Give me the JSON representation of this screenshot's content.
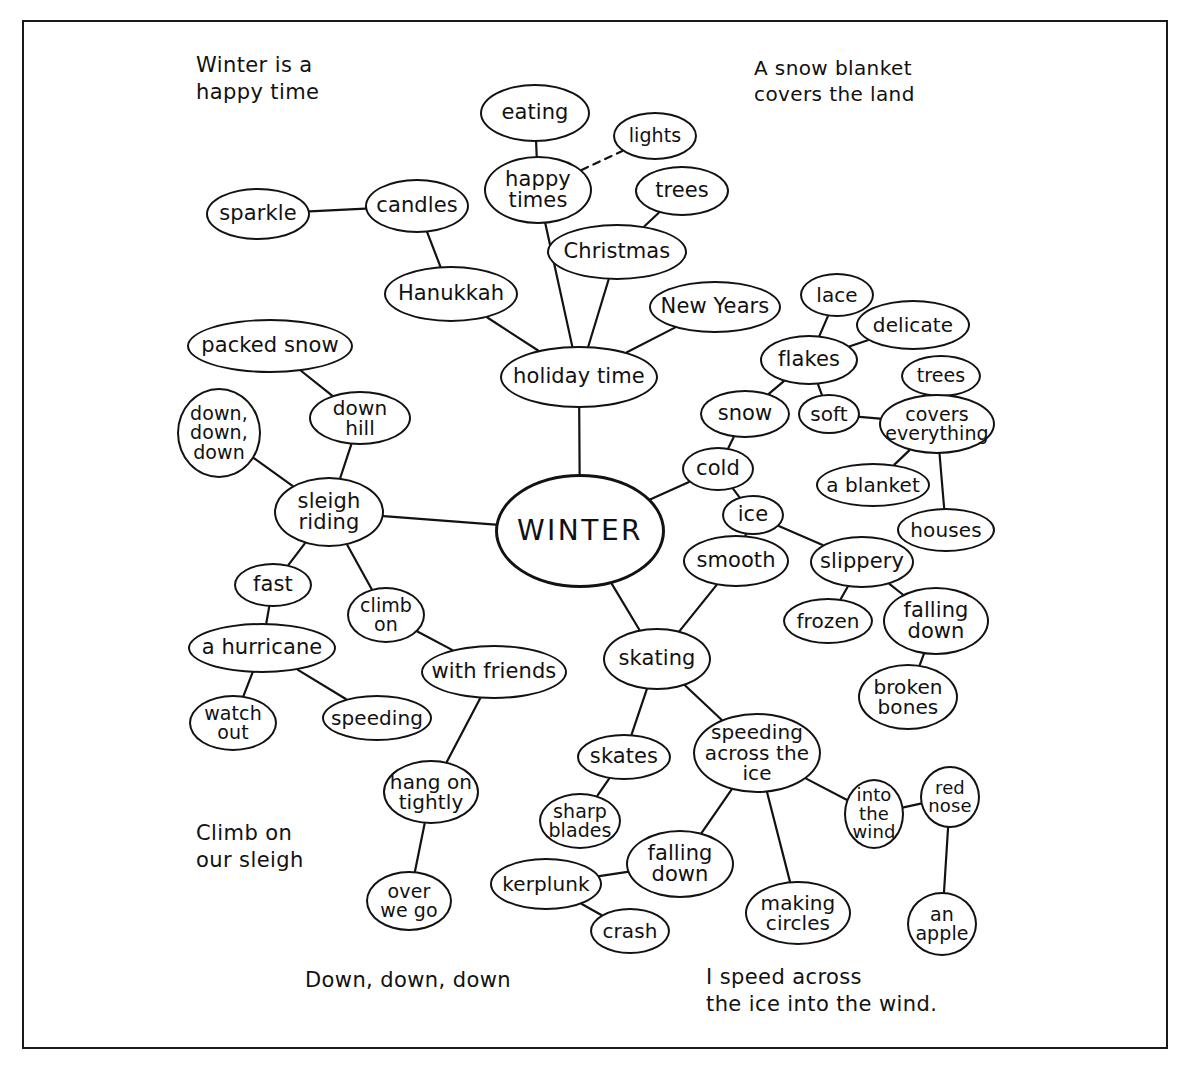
{
  "style": {
    "ink": "#121212",
    "paper": "#ffffff"
  },
  "captions": [
    {
      "id": "cap-winter-happy",
      "text": "Winter is a\nhappy time",
      "x": 196,
      "y": 52,
      "size": 21
    },
    {
      "id": "cap-snow-blanket",
      "text": "A snow blanket\ncovers the land",
      "x": 754,
      "y": 56,
      "size": 20
    },
    {
      "id": "cap-climb-sleigh",
      "text": "Climb on\nour sleigh",
      "x": 196,
      "y": 820,
      "size": 21
    },
    {
      "id": "cap-down-down-down",
      "text": "Down, down, down",
      "x": 305,
      "y": 967,
      "size": 21
    },
    {
      "id": "cap-speed-ice",
      "text": "I speed across\nthe ice into the wind.",
      "x": 706,
      "y": 964,
      "size": 21
    }
  ],
  "central_node": "winter",
  "nodes": [
    {
      "id": "eating",
      "label": "eating",
      "cx": 535,
      "cy": 113,
      "rx": 55,
      "ry": 29,
      "size": 21
    },
    {
      "id": "lights",
      "label": "lights",
      "cx": 655,
      "cy": 136,
      "rx": 42,
      "ry": 24,
      "size": 19
    },
    {
      "id": "happy-times",
      "label": "happy\ntimes",
      "cx": 538,
      "cy": 190,
      "rx": 54,
      "ry": 34,
      "size": 21
    },
    {
      "id": "trees-top",
      "label": "trees",
      "cx": 682,
      "cy": 191,
      "rx": 47,
      "ry": 25,
      "size": 21
    },
    {
      "id": "christmas",
      "label": "Christmas",
      "cx": 617,
      "cy": 252,
      "rx": 70,
      "ry": 28,
      "size": 21
    },
    {
      "id": "sparkle",
      "label": "sparkle",
      "cx": 258,
      "cy": 214,
      "rx": 52,
      "ry": 26,
      "size": 21
    },
    {
      "id": "candles",
      "label": "candles",
      "cx": 417,
      "cy": 206,
      "rx": 52,
      "ry": 27,
      "size": 21
    },
    {
      "id": "hanukkah",
      "label": "Hanukkah",
      "cx": 451,
      "cy": 294,
      "rx": 67,
      "ry": 28,
      "size": 21
    },
    {
      "id": "new-years",
      "label": "New Years",
      "cx": 715,
      "cy": 307,
      "rx": 66,
      "ry": 26,
      "size": 21
    },
    {
      "id": "lace",
      "label": "lace",
      "cx": 837,
      "cy": 295,
      "rx": 37,
      "ry": 22,
      "size": 20
    },
    {
      "id": "delicate",
      "label": "delicate",
      "cx": 913,
      "cy": 325,
      "rx": 57,
      "ry": 25,
      "size": 20
    },
    {
      "id": "flakes",
      "label": "flakes",
      "cx": 809,
      "cy": 360,
      "rx": 49,
      "ry": 25,
      "size": 21
    },
    {
      "id": "trees-right",
      "label": "trees",
      "cx": 941,
      "cy": 376,
      "rx": 40,
      "ry": 21,
      "size": 19
    },
    {
      "id": "holiday-time",
      "label": "holiday time",
      "cx": 579,
      "cy": 377,
      "rx": 79,
      "ry": 31,
      "size": 21
    },
    {
      "id": "packed-snow",
      "label": "packed snow",
      "cx": 270,
      "cy": 346,
      "rx": 83,
      "ry": 27,
      "size": 21
    },
    {
      "id": "down-hill",
      "label": "down\nhill",
      "cx": 360,
      "cy": 418,
      "rx": 51,
      "ry": 27,
      "size": 20
    },
    {
      "id": "snow",
      "label": "snow",
      "cx": 745,
      "cy": 414,
      "rx": 45,
      "ry": 24,
      "size": 21
    },
    {
      "id": "soft",
      "label": "soft",
      "cx": 829,
      "cy": 414,
      "rx": 31,
      "ry": 20,
      "size": 20
    },
    {
      "id": "covers-everything",
      "label": "covers\neverything",
      "cx": 937,
      "cy": 424,
      "rx": 58,
      "ry": 30,
      "size": 19
    },
    {
      "id": "down-down-down",
      "label": "down,\ndown,\ndown",
      "cx": 219,
      "cy": 433,
      "rx": 42,
      "ry": 45,
      "size": 19
    },
    {
      "id": "cold",
      "label": "cold",
      "cx": 718,
      "cy": 469,
      "rx": 36,
      "ry": 22,
      "size": 21
    },
    {
      "id": "a-blanket",
      "label": "a blanket",
      "cx": 873,
      "cy": 485,
      "rx": 57,
      "ry": 22,
      "size": 20
    },
    {
      "id": "sleigh-riding",
      "label": "sleigh\nriding",
      "cx": 329,
      "cy": 512,
      "rx": 55,
      "ry": 35,
      "size": 21
    },
    {
      "id": "ice",
      "label": "ice",
      "cx": 753,
      "cy": 515,
      "rx": 31,
      "ry": 20,
      "size": 21
    },
    {
      "id": "houses",
      "label": "houses",
      "cx": 946,
      "cy": 530,
      "rx": 49,
      "ry": 22,
      "size": 20
    },
    {
      "id": "winter",
      "label": "WINTER",
      "cx": 580,
      "cy": 531,
      "rx": 85,
      "ry": 57,
      "size": 28
    },
    {
      "id": "smooth",
      "label": "smooth",
      "cx": 736,
      "cy": 561,
      "rx": 53,
      "ry": 26,
      "size": 21
    },
    {
      "id": "slippery",
      "label": "slippery",
      "cx": 862,
      "cy": 562,
      "rx": 52,
      "ry": 26,
      "size": 21
    },
    {
      "id": "fast",
      "label": "fast",
      "cx": 273,
      "cy": 585,
      "rx": 39,
      "ry": 22,
      "size": 21
    },
    {
      "id": "climb-on",
      "label": "climb\non",
      "cx": 386,
      "cy": 615,
      "rx": 39,
      "ry": 28,
      "size": 19
    },
    {
      "id": "frozen",
      "label": "frozen",
      "cx": 828,
      "cy": 621,
      "rx": 45,
      "ry": 23,
      "size": 20
    },
    {
      "id": "falling-down-r",
      "label": "falling\ndown",
      "cx": 936,
      "cy": 621,
      "rx": 53,
      "ry": 34,
      "size": 21
    },
    {
      "id": "a-hurricane",
      "label": "a hurricane",
      "cx": 262,
      "cy": 648,
      "rx": 74,
      "ry": 25,
      "size": 21
    },
    {
      "id": "with-friends",
      "label": "with friends",
      "cx": 494,
      "cy": 672,
      "rx": 73,
      "ry": 27,
      "size": 21
    },
    {
      "id": "skating",
      "label": "skating",
      "cx": 657,
      "cy": 659,
      "rx": 54,
      "ry": 31,
      "size": 21
    },
    {
      "id": "broken-bones",
      "label": "broken\nbones",
      "cx": 908,
      "cy": 697,
      "rx": 50,
      "ry": 33,
      "size": 20
    },
    {
      "id": "watch-out",
      "label": "watch\nout",
      "cx": 233,
      "cy": 723,
      "rx": 44,
      "ry": 28,
      "size": 19
    },
    {
      "id": "speeding",
      "label": "speeding",
      "cx": 377,
      "cy": 718,
      "rx": 55,
      "ry": 23,
      "size": 20
    },
    {
      "id": "skates",
      "label": "skates",
      "cx": 624,
      "cy": 757,
      "rx": 47,
      "ry": 23,
      "size": 21
    },
    {
      "id": "speeding-ice",
      "label": "speeding\nacross the\nice",
      "cx": 757,
      "cy": 753,
      "rx": 64,
      "ry": 40,
      "size": 20
    },
    {
      "id": "hang-on-tightly",
      "label": "hang on\ntightly",
      "cx": 431,
      "cy": 792,
      "rx": 48,
      "ry": 32,
      "size": 20
    },
    {
      "id": "into-the-wind",
      "label": "into\nthe\nwind",
      "cx": 874,
      "cy": 814,
      "rx": 30,
      "ry": 35,
      "size": 18
    },
    {
      "id": "red-nose",
      "label": "red\nnose",
      "cx": 950,
      "cy": 797,
      "rx": 30,
      "ry": 31,
      "size": 18
    },
    {
      "id": "sharp-blades",
      "label": "sharp\nblades",
      "cx": 580,
      "cy": 821,
      "rx": 41,
      "ry": 28,
      "size": 19
    },
    {
      "id": "falling-down-b",
      "label": "falling\ndown",
      "cx": 680,
      "cy": 864,
      "rx": 54,
      "ry": 34,
      "size": 21
    },
    {
      "id": "kerplunk",
      "label": "kerplunk",
      "cx": 546,
      "cy": 884,
      "rx": 56,
      "ry": 26,
      "size": 20
    },
    {
      "id": "over-we-go",
      "label": "over\nwe go",
      "cx": 409,
      "cy": 901,
      "rx": 43,
      "ry": 30,
      "size": 19
    },
    {
      "id": "making-circles",
      "label": "making\ncircles",
      "cx": 798,
      "cy": 913,
      "rx": 53,
      "ry": 32,
      "size": 20
    },
    {
      "id": "crash",
      "label": "crash",
      "cx": 630,
      "cy": 931,
      "rx": 40,
      "ry": 23,
      "size": 20
    },
    {
      "id": "an-apple",
      "label": "an\napple",
      "cx": 942,
      "cy": 924,
      "rx": 35,
      "ry": 32,
      "size": 19
    }
  ],
  "edges": [
    {
      "from": "eating",
      "to": "happy-times",
      "style": "solid"
    },
    {
      "from": "happy-times",
      "to": "lights",
      "style": "dashed"
    },
    {
      "from": "happy-times",
      "to": "holiday-time",
      "style": "solid"
    },
    {
      "from": "sparkle",
      "to": "candles",
      "style": "solid"
    },
    {
      "from": "candles",
      "to": "hanukkah",
      "style": "solid"
    },
    {
      "from": "hanukkah",
      "to": "holiday-time",
      "style": "solid"
    },
    {
      "from": "trees-top",
      "to": "christmas",
      "style": "solid"
    },
    {
      "from": "christmas",
      "to": "holiday-time",
      "style": "solid"
    },
    {
      "from": "new-years",
      "to": "holiday-time",
      "style": "solid"
    },
    {
      "from": "holiday-time",
      "to": "winter",
      "style": "solid"
    },
    {
      "from": "lace",
      "to": "flakes",
      "style": "solid"
    },
    {
      "from": "delicate",
      "to": "flakes",
      "style": "solid"
    },
    {
      "from": "flakes",
      "to": "snow",
      "style": "solid"
    },
    {
      "from": "flakes",
      "to": "soft",
      "style": "solid"
    },
    {
      "from": "soft",
      "to": "covers-everything",
      "style": "solid"
    },
    {
      "from": "trees-right",
      "to": "covers-everything",
      "style": "solid"
    },
    {
      "from": "covers-everything",
      "to": "a-blanket",
      "style": "solid"
    },
    {
      "from": "covers-everything",
      "to": "houses",
      "style": "solid"
    },
    {
      "from": "snow",
      "to": "cold",
      "style": "solid"
    },
    {
      "from": "cold",
      "to": "winter",
      "style": "solid"
    },
    {
      "from": "cold",
      "to": "ice",
      "style": "solid"
    },
    {
      "from": "ice",
      "to": "smooth",
      "style": "solid"
    },
    {
      "from": "ice",
      "to": "slippery",
      "style": "solid"
    },
    {
      "from": "slippery",
      "to": "frozen",
      "style": "solid"
    },
    {
      "from": "slippery",
      "to": "falling-down-r",
      "style": "solid"
    },
    {
      "from": "falling-down-r",
      "to": "broken-bones",
      "style": "solid"
    },
    {
      "from": "smooth",
      "to": "skating",
      "style": "solid"
    },
    {
      "from": "winter",
      "to": "skating",
      "style": "solid"
    },
    {
      "from": "winter",
      "to": "sleigh-riding",
      "style": "solid"
    },
    {
      "from": "packed-snow",
      "to": "down-hill",
      "style": "solid"
    },
    {
      "from": "down-hill",
      "to": "sleigh-riding",
      "style": "solid"
    },
    {
      "from": "down-down-down",
      "to": "sleigh-riding",
      "style": "solid"
    },
    {
      "from": "sleigh-riding",
      "to": "fast",
      "style": "solid"
    },
    {
      "from": "sleigh-riding",
      "to": "climb-on",
      "style": "solid"
    },
    {
      "from": "fast",
      "to": "a-hurricane",
      "style": "solid"
    },
    {
      "from": "a-hurricane",
      "to": "watch-out",
      "style": "solid"
    },
    {
      "from": "a-hurricane",
      "to": "speeding",
      "style": "solid"
    },
    {
      "from": "climb-on",
      "to": "with-friends",
      "style": "solid"
    },
    {
      "from": "with-friends",
      "to": "hang-on-tightly",
      "style": "solid"
    },
    {
      "from": "hang-on-tightly",
      "to": "over-we-go",
      "style": "solid"
    },
    {
      "from": "skating",
      "to": "skates",
      "style": "solid"
    },
    {
      "from": "skating",
      "to": "speeding-ice",
      "style": "solid"
    },
    {
      "from": "skates",
      "to": "sharp-blades",
      "style": "solid"
    },
    {
      "from": "speeding-ice",
      "to": "falling-down-b",
      "style": "solid"
    },
    {
      "from": "speeding-ice",
      "to": "making-circles",
      "style": "solid"
    },
    {
      "from": "speeding-ice",
      "to": "into-the-wind",
      "style": "solid"
    },
    {
      "from": "falling-down-b",
      "to": "kerplunk",
      "style": "solid"
    },
    {
      "from": "kerplunk",
      "to": "crash",
      "style": "solid"
    },
    {
      "from": "into-the-wind",
      "to": "red-nose",
      "style": "solid"
    },
    {
      "from": "red-nose",
      "to": "an-apple",
      "style": "solid"
    }
  ]
}
